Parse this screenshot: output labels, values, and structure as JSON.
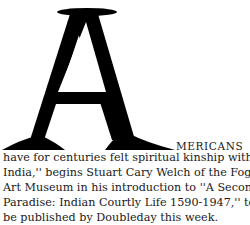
{
  "article": {
    "drop_cap": "A",
    "first_line_tail": "MERICANS",
    "lines": [
      "have for centuries felt spiritual kinship with",
      "India,'' begins Stuart Cary Welch of the Fogg",
      "Art Museum in his introduction to ''A Second",
      "Paradise: Indian Courtly Life 1590-1947,'' to",
      "be published by Doubleday this week."
    ]
  }
}
